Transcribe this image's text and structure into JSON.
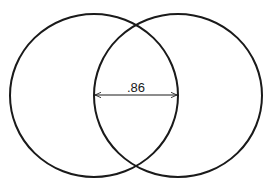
{
  "diagram": {
    "type": "overlapping-circles",
    "circles": [
      {
        "name": "left-circle",
        "cx": 94,
        "cy": 95.5,
        "rx": 84,
        "ry": 81.5
      },
      {
        "name": "right-circle",
        "cx": 178,
        "cy": 95.5,
        "rx": 84,
        "ry": 81.5
      }
    ],
    "dimension": {
      "label": ".86",
      "x1": 94,
      "x2": 178,
      "y": 95
    },
    "colors": {
      "stroke": "#1a1a1a",
      "background": "#ffffff"
    }
  }
}
